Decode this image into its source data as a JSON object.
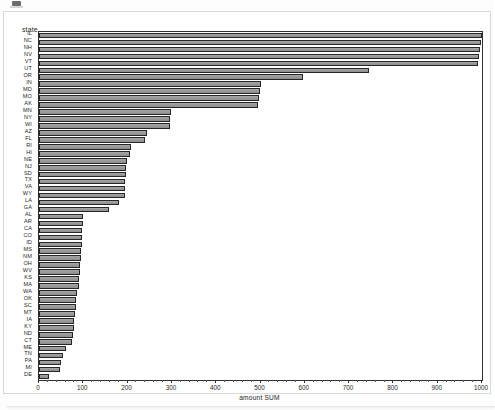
{
  "page": {
    "background_color": "#fdfdfd",
    "card_border_color": "#d9d9d9"
  },
  "axis_caption": "state",
  "x_title": "amount SUM",
  "colors": {
    "bar_fill": "#9e9e9e",
    "bar_border": "#262626",
    "axis": "#2f2f2f",
    "text": "#1f1f1f"
  },
  "chart_data": {
    "type": "bar",
    "orientation": "horizontal",
    "title": "",
    "subtitle": "",
    "xlabel": "amount SUM",
    "ylabel": "state",
    "xlim": [
      0,
      1000
    ],
    "ylim": null,
    "grid": false,
    "legend": null,
    "xticks": [
      0,
      100,
      200,
      300,
      400,
      500,
      600,
      700,
      800,
      900,
      1000
    ],
    "xtick_labels": [
      "0",
      "100",
      "200",
      "300",
      "400",
      "500",
      "600",
      "700",
      "800",
      "900",
      "1000"
    ],
    "minor_tick_count_between": 4,
    "categories": [
      "IL",
      "NC",
      "NH",
      "NV",
      "VT",
      "UT",
      "OR",
      "IN",
      "MD",
      "MO",
      "AK",
      "MN",
      "NY",
      "WI",
      "AZ",
      "FL",
      "RI",
      "HI",
      "NE",
      "NJ",
      "SD",
      "TX",
      "VA",
      "WY",
      "LA",
      "GA",
      "AL",
      "AR",
      "CA",
      "CO",
      "ID",
      "MS",
      "NM",
      "OH",
      "WV",
      "KS",
      "MA",
      "WA",
      "OK",
      "SC",
      "MT",
      "IA",
      "KY",
      "ND",
      "CT",
      "ME",
      "TN",
      "PA",
      "MI",
      "DE"
    ],
    "values": [
      1000,
      998,
      996,
      994,
      992,
      745,
      595,
      500,
      498,
      497,
      495,
      297,
      296,
      295,
      243,
      240,
      207,
      205,
      198,
      197,
      196,
      195,
      194,
      193,
      180,
      158,
      100,
      99,
      98,
      97,
      96,
      95,
      94,
      93,
      92,
      91,
      90,
      85,
      84,
      83,
      82,
      80,
      78,
      76,
      74,
      62,
      54,
      50,
      48,
      22
    ],
    "series": [
      {
        "name": "amount SUM",
        "values": [
          1000,
          998,
          996,
          994,
          992,
          745,
          595,
          500,
          498,
          497,
          495,
          297,
          296,
          295,
          243,
          240,
          207,
          205,
          198,
          197,
          196,
          195,
          194,
          193,
          180,
          158,
          100,
          99,
          98,
          97,
          96,
          95,
          94,
          93,
          92,
          91,
          90,
          85,
          84,
          83,
          82,
          80,
          78,
          76,
          74,
          62,
          54,
          50,
          48,
          22
        ]
      }
    ]
  }
}
